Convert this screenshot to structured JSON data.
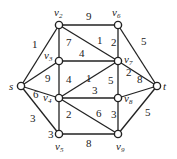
{
  "graph": {
    "nodes": [
      {
        "id": "s",
        "label": "s",
        "x": 21,
        "y": 86,
        "lx": 9,
        "ly": 90
      },
      {
        "id": "v2",
        "label": "v2",
        "x": 59,
        "y": 25,
        "lx": 54,
        "ly": 16
      },
      {
        "id": "v3",
        "label": "v3",
        "x": 59,
        "y": 61,
        "lx": 44,
        "ly": 59
      },
      {
        "id": "v4",
        "label": "v4",
        "x": 59,
        "y": 98,
        "lx": 43,
        "ly": 101
      },
      {
        "id": "v5",
        "label": "v5",
        "x": 59,
        "y": 134,
        "lx": 55,
        "ly": 150
      },
      {
        "id": "v6",
        "label": "v6",
        "x": 118,
        "y": 25,
        "lx": 112,
        "ly": 16
      },
      {
        "id": "v7",
        "label": "v7",
        "x": 118,
        "y": 61,
        "lx": 124,
        "ly": 63
      },
      {
        "id": "v8",
        "label": "v8",
        "x": 118,
        "y": 98,
        "lx": 124,
        "ly": 102
      },
      {
        "id": "v9",
        "label": "v9",
        "x": 118,
        "y": 134,
        "lx": 116,
        "ly": 150
      },
      {
        "id": "t",
        "label": "t",
        "x": 157,
        "y": 86,
        "lx": 163,
        "ly": 90
      }
    ],
    "edges": [
      {
        "from": "s",
        "to": "v2",
        "w": "1",
        "lx": 32,
        "ly": 48
      },
      {
        "from": "s",
        "to": "v3",
        "w": "9",
        "lx": 45,
        "ly": 82
      },
      {
        "from": "s",
        "to": "v4",
        "w": "6",
        "lx": 33,
        "ly": 98
      },
      {
        "from": "s",
        "to": "v5",
        "w": "3",
        "lx": 30,
        "ly": 122
      },
      {
        "from": "v2",
        "to": "v6",
        "w": "9",
        "lx": 86,
        "ly": 20
      },
      {
        "from": "v2",
        "to": "v3",
        "w": "7",
        "lx": 66,
        "ly": 46
      },
      {
        "from": "v2",
        "to": "v7",
        "w": "1",
        "lx": 97,
        "ly": 44
      },
      {
        "from": "v6",
        "to": "v7",
        "w": "2",
        "lx": 111,
        "ly": 46
      },
      {
        "from": "v6",
        "to": "t",
        "w": "5",
        "lx": 141,
        "ly": 45
      },
      {
        "from": "v3",
        "to": "v7",
        "w": "4",
        "lx": 79,
        "ly": 57
      },
      {
        "from": "v3",
        "to": "v4",
        "w": "4",
        "lx": 66,
        "ly": 83
      },
      {
        "from": "v4",
        "to": "v7",
        "w": "1",
        "lx": 86,
        "ly": 82
      },
      {
        "from": "v4",
        "to": "v8",
        "w": "3",
        "lx": 92,
        "ly": 94
      },
      {
        "from": "v7",
        "to": "v8",
        "w": "5",
        "lx": 108,
        "ly": 84
      },
      {
        "from": "v7",
        "to": "t",
        "w": "2",
        "lx": 126,
        "ly": 76
      },
      {
        "from": "v8",
        "to": "t",
        "w": "8",
        "lx": 137,
        "ly": 83
      },
      {
        "from": "v4",
        "to": "v5",
        "w": "2",
        "lx": 66,
        "ly": 118
      },
      {
        "from": "v4",
        "to": "v9",
        "w": "6",
        "lx": 96,
        "ly": 117
      },
      {
        "from": "v8",
        "to": "v9",
        "w": "3",
        "lx": 111,
        "ly": 118
      },
      {
        "from": "v9",
        "to": "t",
        "w": "5",
        "lx": 145,
        "ly": 116
      },
      {
        "from": "v5",
        "to": "v9",
        "w": "8",
        "lx": 86,
        "ly": 147
      }
    ],
    "extra_labels": [
      {
        "text": "3",
        "x": 48,
        "y": 138
      }
    ]
  }
}
